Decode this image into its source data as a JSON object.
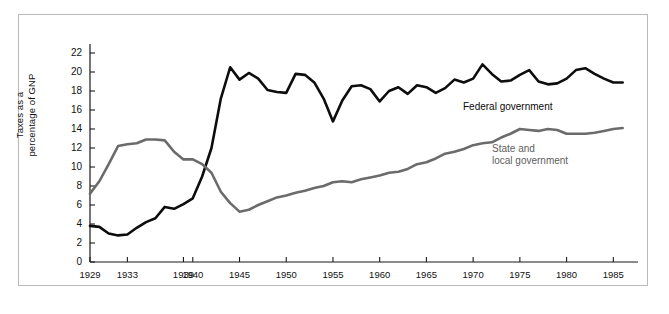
{
  "figure": {
    "y_axis_label_line1": "Taxes as a",
    "y_axis_label_line2": "percentage of GNP",
    "series_label_federal": "Federal government",
    "series_label_state": "State and\nlocal government"
  },
  "chart_data": {
    "type": "line",
    "title": "",
    "xlabel": "",
    "ylabel": "Taxes as a percentage of GNP",
    "xlim": [
      1929,
      1987
    ],
    "ylim": [
      0,
      23
    ],
    "yticks": [
      0,
      2,
      4,
      6,
      8,
      10,
      12,
      14,
      16,
      18,
      20,
      22
    ],
    "xticks": [
      1929,
      1933,
      1939,
      1940,
      1945,
      1950,
      1955,
      1960,
      1965,
      1970,
      1975,
      1980,
      1985
    ],
    "xtick_labels": [
      "1929",
      "1933",
      "1939",
      "1940",
      "1945",
      "1950",
      "1955",
      "1960",
      "1965",
      "1970",
      "1975",
      "1980",
      "1985"
    ],
    "grid": false,
    "legend_position": "inline-annotation",
    "colors": {
      "federal": "#0d0d0d",
      "state_local": "#6b6b6b",
      "axis": "#1a1a1a",
      "frame": "#b9b9b9",
      "background": "#ffffff"
    },
    "x": [
      1929,
      1930,
      1931,
      1932,
      1933,
      1934,
      1935,
      1936,
      1937,
      1938,
      1939,
      1940,
      1941,
      1942,
      1943,
      1944,
      1945,
      1946,
      1947,
      1948,
      1949,
      1950,
      1951,
      1952,
      1953,
      1954,
      1955,
      1956,
      1957,
      1958,
      1959,
      1960,
      1961,
      1962,
      1963,
      1964,
      1965,
      1966,
      1967,
      1968,
      1969,
      1970,
      1971,
      1972,
      1973,
      1974,
      1975,
      1976,
      1977,
      1978,
      1979,
      1980,
      1981,
      1982,
      1983,
      1984,
      1985,
      1986
    ],
    "series": [
      {
        "name": "Federal government",
        "color": "#0d0d0d",
        "values": [
          3.8,
          3.7,
          3.0,
          2.8,
          2.9,
          3.6,
          4.2,
          4.6,
          5.8,
          5.6,
          6.1,
          6.7,
          9.0,
          12.0,
          17.2,
          20.5,
          19.2,
          19.9,
          19.3,
          18.1,
          17.9,
          17.8,
          19.8,
          19.7,
          18.9,
          17.2,
          14.8,
          17.0,
          18.5,
          18.6,
          18.2,
          16.9,
          18.0,
          18.4,
          17.7,
          18.6,
          18.4,
          17.8,
          18.3,
          19.2,
          18.9,
          19.3,
          20.8,
          19.8,
          19.0,
          19.1,
          19.7,
          20.2,
          19.0,
          18.7,
          18.8,
          19.3,
          20.2,
          20.4,
          19.8,
          19.3,
          18.9,
          18.9
        ]
      },
      {
        "name": "State and local government",
        "color": "#6b6b6b",
        "values": [
          7.2,
          8.5,
          10.3,
          12.2,
          12.4,
          12.5,
          12.9,
          12.9,
          12.8,
          11.6,
          10.8,
          10.8,
          10.3,
          9.4,
          7.4,
          6.2,
          5.3,
          5.5,
          6.0,
          6.4,
          6.8,
          7.0,
          7.3,
          7.5,
          7.8,
          8.0,
          8.4,
          8.5,
          8.4,
          8.7,
          8.9,
          9.1,
          9.4,
          9.5,
          9.8,
          10.3,
          10.5,
          10.9,
          11.4,
          11.6,
          11.9,
          12.3,
          12.5,
          12.6,
          13.1,
          13.5,
          14.0,
          13.9,
          13.8,
          14.0,
          13.9,
          13.5,
          13.5,
          13.5,
          13.6,
          13.8,
          14.0,
          14.1
        ]
      }
    ]
  }
}
